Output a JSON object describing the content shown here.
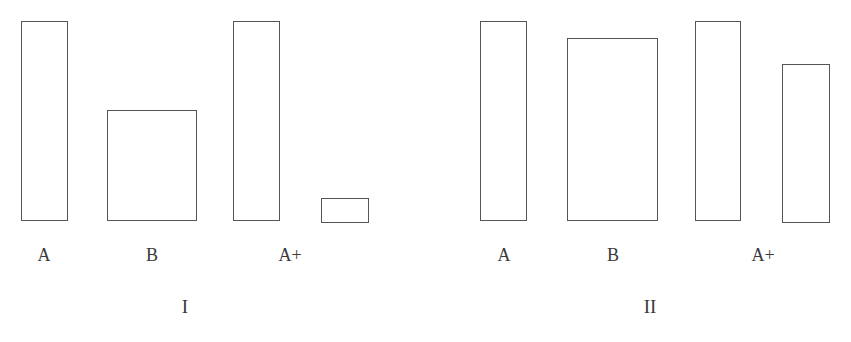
{
  "chart_data": [
    {
      "type": "bar",
      "title": "I",
      "categories": [
        "A",
        "B",
        "A+",
        ""
      ],
      "values": [
        200,
        111,
        200,
        25
      ],
      "bar_widths_px": [
        47,
        90,
        47,
        48
      ],
      "xlabel": "",
      "ylabel": "",
      "grid": false,
      "notes": "Outlined (unfilled) rectangles; B bar is wide; a small unlabeled short bar follows A+."
    },
    {
      "type": "bar",
      "title": "II",
      "categories": [
        "A",
        "B",
        "A+",
        ""
      ],
      "values": [
        200,
        183,
        200,
        159
      ],
      "bar_widths_px": [
        47,
        91,
        46,
        48
      ],
      "xlabel": "",
      "ylabel": "",
      "grid": false,
      "notes": "Outlined (unfilled) rectangles; B bar is wide and tall; unlabeled 4th bar after A+."
    }
  ],
  "panels": [
    {
      "label": "I",
      "bars": [
        {
          "label": "A",
          "x": 21,
          "y": 21,
          "w": 47,
          "h": 200
        },
        {
          "label": "B",
          "x": 107,
          "y": 110,
          "w": 90,
          "h": 111
        },
        {
          "label": "A+",
          "x": 233,
          "y": 21,
          "w": 47,
          "h": 200
        },
        {
          "label": "",
          "x": 321,
          "y": 198,
          "w": 48,
          "h": 25
        }
      ],
      "tick_labels": [
        {
          "text": "A",
          "cx": 44
        },
        {
          "text": "B",
          "cx": 152
        },
        {
          "text": "A+",
          "cx": 290
        }
      ],
      "panel_label_cx": 185
    },
    {
      "label": "II",
      "bars": [
        {
          "label": "A",
          "x": 480,
          "y": 21,
          "w": 47,
          "h": 200
        },
        {
          "label": "B",
          "x": 567,
          "y": 38,
          "w": 91,
          "h": 183
        },
        {
          "label": "A+",
          "x": 695,
          "y": 21,
          "w": 46,
          "h": 200
        },
        {
          "label": "",
          "x": 782,
          "y": 64,
          "w": 48,
          "h": 159
        }
      ],
      "tick_labels": [
        {
          "text": "A",
          "cx": 504
        },
        {
          "text": "B",
          "cx": 613
        },
        {
          "text": "A+",
          "cx": 763
        }
      ],
      "panel_label_cx": 650
    }
  ],
  "colors": {
    "outline": "#555555",
    "text": "#3a3a3a",
    "background": "#ffffff"
  }
}
